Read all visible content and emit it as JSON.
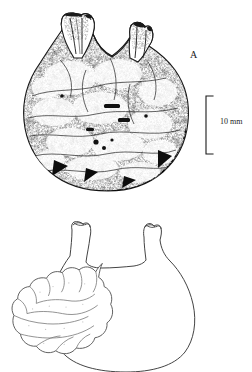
{
  "figure": {
    "type": "scientific-line-illustration",
    "caption_labels": {
      "panel_a": "A",
      "panel_b": "B"
    },
    "scale_bar": {
      "label": "10 mm",
      "orientation": "vertical",
      "length_px": 58
    },
    "colors": {
      "background": "#ffffff",
      "ink": "#1a1a1a",
      "outline": "#3a3a3a",
      "stipple": "#2b2b2b"
    },
    "panels": [
      {
        "id": "A",
        "description": "Stippled rendering of a whole tunicate specimen with two siphons at top",
        "render": "textured"
      },
      {
        "id": "B",
        "description": "Outline drawing of the same specimen showing internal lobed mass",
        "render": "outline"
      }
    ]
  }
}
